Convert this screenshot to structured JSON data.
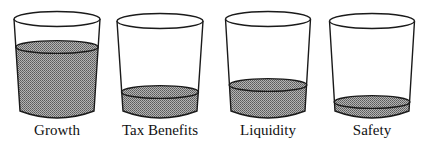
{
  "title": "",
  "colors": {
    "outline": "#1a1a1a",
    "liquid": "#8c8c8c",
    "background": "#ffffff"
  },
  "glasses": [
    {
      "label": "Growth",
      "fill_level": 0.82,
      "cx": 57,
      "top_w": 86,
      "bot_w": 74,
      "top_y": 19,
      "liquid_y": 47,
      "bot_y": 118
    },
    {
      "label": "Tax Benefits",
      "fill_level": 0.26,
      "cx": 160,
      "top_w": 86,
      "bot_w": 74,
      "top_y": 21,
      "liquid_y": 92,
      "bot_y": 118
    },
    {
      "label": "Liquidity",
      "fill_level": 0.36,
      "cx": 268,
      "top_w": 85,
      "bot_w": 74,
      "top_y": 19,
      "liquid_y": 85,
      "bot_y": 118
    },
    {
      "label": "Safety",
      "fill_level": 0.16,
      "cx": 372,
      "top_w": 85,
      "bot_w": 74,
      "top_y": 21,
      "liquid_y": 102,
      "bot_y": 118
    }
  ]
}
